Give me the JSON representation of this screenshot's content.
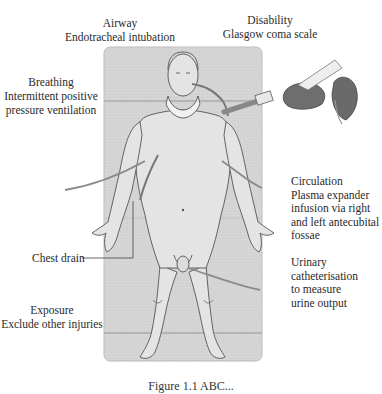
{
  "labels": {
    "airway": {
      "title": "Airway",
      "detail": "Endotracheal intubation"
    },
    "disability": {
      "title": "Disability",
      "detail": "Glasgow coma scale"
    },
    "breathing": {
      "title": "Breathing",
      "detail_lines": [
        "Intermittent positive",
        "pressure ventilation"
      ]
    },
    "circulation": {
      "title": "Circulation",
      "detail_lines": [
        "Plasma expander",
        "infusion via right",
        "and left antecubital",
        "fossae"
      ]
    },
    "chest_drain": {
      "title": "Chest drain"
    },
    "urinary": {
      "title": "Urinary",
      "detail_lines": [
        "catheterisation",
        "to measure",
        "urine output"
      ]
    },
    "exposure": {
      "title": "Exposure",
      "detail": "Exclude other injuries"
    }
  },
  "caption": {
    "text": "Figure 1.1  ABC..."
  },
  "colors": {
    "background": "#ffffff",
    "board": "#d9d9d9",
    "board_edge": "#bdbdbd",
    "outline": "#555555",
    "tube": "#8a8a8a",
    "bag": "#6e6e6e",
    "text": "#2a2a2a"
  }
}
